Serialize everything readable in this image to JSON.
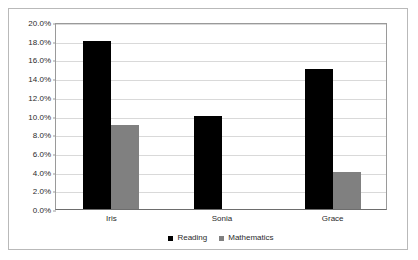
{
  "chart_data": {
    "type": "bar",
    "title": "",
    "subtitle": "",
    "xlabel": "",
    "ylabel": "",
    "categories": [
      "Iris",
      "Sonia",
      "Grace"
    ],
    "series": [
      {
        "name": "Reading",
        "color": "#000000",
        "values": [
          18.0,
          10.0,
          15.0
        ]
      },
      {
        "name": "Mathematics",
        "color": "#808080",
        "values": [
          9.0,
          0.0,
          4.0
        ]
      }
    ],
    "ylim": [
      0.0,
      20.0
    ],
    "ytick_step": 2.0,
    "ytick_labels": [
      "0.0%",
      "2.0%",
      "4.0%",
      "6.0%",
      "8.0%",
      "10.0%",
      "12.0%",
      "14.0%",
      "16.0%",
      "18.0%",
      "20.0%"
    ],
    "ytick_values": [
      0,
      2,
      4,
      6,
      8,
      10,
      12,
      14,
      16,
      18,
      20
    ],
    "value_suffix": "%",
    "grid": true,
    "grid_axis": "y",
    "legend_position": "bottom-center",
    "legend_entries": [
      "Reading",
      "Mathematics"
    ],
    "gridline_color": "#d9d9d9",
    "axis_color": "#9a9a9a",
    "frame_color": "#b9b9b9",
    "background_color": "#ffffff"
  }
}
